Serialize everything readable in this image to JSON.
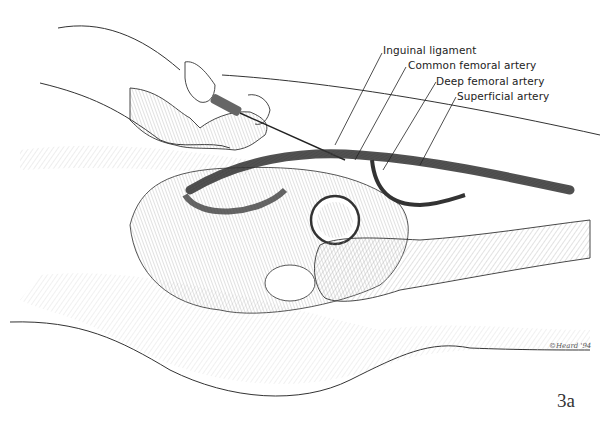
{
  "figure": {
    "number": "3a",
    "signature": "©Heard '94"
  },
  "labels": [
    {
      "text": "Inguinal ligament",
      "x": 383,
      "y": 44
    },
    {
      "text": "Common femoral artery",
      "x": 408,
      "y": 59
    },
    {
      "text": "Deep femoral artery",
      "x": 436,
      "y": 75
    },
    {
      "text": "Superficial artery",
      "x": 457,
      "y": 90
    }
  ],
  "colors": {
    "ink": "#222222",
    "hatch": "#9a9a9a",
    "background": "#ffffff"
  }
}
